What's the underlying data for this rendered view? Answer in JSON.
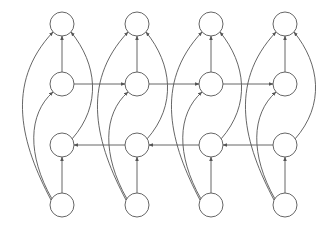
{
  "diagram": {
    "type": "bidirectional-rnn-graph",
    "stroke_color": "#555555",
    "node_fill": "#ffffff",
    "node_radius": 12,
    "columns_x": [
      62,
      137,
      211,
      285
    ],
    "rows": [
      {
        "id": "output",
        "y": 24
      },
      {
        "id": "forward_hidden",
        "y": 84
      },
      {
        "id": "backward_hidden",
        "y": 145
      },
      {
        "id": "input",
        "y": 205
      }
    ],
    "edges_per_column": [
      {
        "from": "input",
        "to": "backward_hidden",
        "kind": "straight"
      },
      {
        "from": "forward_hidden",
        "to": "output",
        "kind": "straight"
      },
      {
        "from": "input",
        "to": "output",
        "kind": "left-wide-curve"
      },
      {
        "from": "input",
        "to": "forward_hidden",
        "kind": "left-curve"
      },
      {
        "from": "backward_hidden",
        "to": "output",
        "kind": "right-curve"
      }
    ],
    "recurrent_edges": [
      {
        "row": "forward_hidden",
        "direction": "right"
      },
      {
        "row": "backward_hidden",
        "direction": "left"
      }
    ]
  }
}
